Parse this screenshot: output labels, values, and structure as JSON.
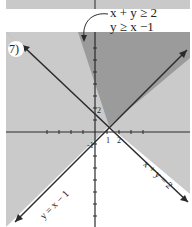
{
  "problem": {
    "number": "7)",
    "inequalities": [
      "x + y ≥ 2",
      "y ≥ x −1"
    ],
    "line_labels": [
      "y = x − 1",
      "x + y = 2"
    ],
    "tick_labels": {
      "y2": "2",
      "x1": "1",
      "x2": "2",
      "yneg1": "-1"
    }
  },
  "colors": {
    "overlap": "#9b9b9b",
    "single": "#cacaca",
    "none": "#ffffff",
    "line": "#2a2a2a"
  }
}
